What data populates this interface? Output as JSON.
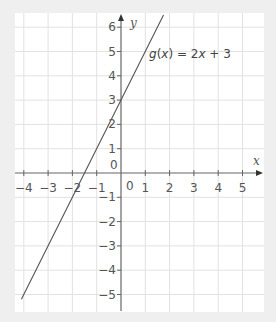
{
  "chart_data": {
    "type": "line",
    "title": "",
    "xlabel": "x",
    "ylabel": "y",
    "xlim": [
      -4.5,
      5.9
    ],
    "ylim": [
      -5.7,
      6.5
    ],
    "grid": true,
    "x_ticks": [
      -4,
      -3,
      -2,
      -1,
      1,
      2,
      3,
      4,
      5
    ],
    "y_ticks": [
      -5,
      -4,
      -3,
      -2,
      -1,
      1,
      2,
      3,
      4,
      5,
      6
    ],
    "origin_label": "0",
    "series": [
      {
        "name": "g(x) = 2x + 3",
        "equation": "g(x) = 2x + 3",
        "slope": 2,
        "intercept": 3,
        "x": [
          -4.1,
          1.75
        ],
        "y": [
          -5.2,
          6.5
        ],
        "color": "#555555"
      }
    ],
    "annotations": [
      {
        "text": "g(x) = 2x + 3",
        "x": 1.2,
        "y": 4.8
      }
    ]
  },
  "labels": {
    "x_axis": "x",
    "y_axis": "y",
    "origin": "0",
    "origin_alt": "0",
    "fn_name": "g",
    "fn_arg": "x",
    "fn_rest": " = 2",
    "fn_var": "x",
    "fn_tail": " + 3"
  },
  "colors": {
    "background": "#efefef",
    "plot_bg": "#ffffff",
    "grid": "#e2e2e2",
    "axis": "#666666",
    "line": "#555555"
  }
}
